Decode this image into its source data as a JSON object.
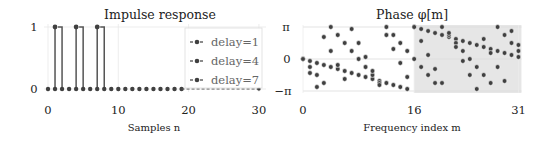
{
  "chart_data": [
    {
      "type": "line",
      "title": "Impulse response",
      "xlabel": "Samples n",
      "ylabel": "",
      "xlim": [
        0,
        31
      ],
      "ylim": [
        0,
        1
      ],
      "xticks": [
        0,
        10,
        20,
        30
      ],
      "yticks": [
        "0",
        "1"
      ],
      "grid": true,
      "legend_position": "upper right",
      "legend": [
        "delay=1",
        "delay=4",
        "delay=7"
      ],
      "series": [
        {
          "name": "delay=1",
          "delay": 1,
          "x": [
            0,
            1,
            2,
            3,
            4,
            5,
            6,
            7,
            8,
            9,
            10,
            11,
            12,
            13,
            14,
            15,
            16,
            17,
            18,
            19,
            20,
            21,
            22,
            23,
            24,
            25,
            26,
            27,
            28,
            29,
            30,
            31
          ],
          "values": [
            0,
            1,
            0,
            0,
            0,
            0,
            0,
            0,
            0,
            0,
            0,
            0,
            0,
            0,
            0,
            0,
            0,
            0,
            0,
            0,
            0,
            0,
            0,
            0,
            0,
            0,
            0,
            0,
            0,
            0,
            0,
            0
          ]
        },
        {
          "name": "delay=4",
          "delay": 4,
          "x": [
            0,
            1,
            2,
            3,
            4,
            5,
            6,
            7,
            8,
            9,
            10,
            11,
            12,
            13,
            14,
            15,
            16,
            17,
            18,
            19,
            20,
            21,
            22,
            23,
            24,
            25,
            26,
            27,
            28,
            29,
            30,
            31
          ],
          "values": [
            0,
            0,
            0,
            0,
            1,
            0,
            0,
            0,
            0,
            0,
            0,
            0,
            0,
            0,
            0,
            0,
            0,
            0,
            0,
            0,
            0,
            0,
            0,
            0,
            0,
            0,
            0,
            0,
            0,
            0,
            0,
            0
          ]
        },
        {
          "name": "delay=7",
          "delay": 7,
          "x": [
            0,
            1,
            2,
            3,
            4,
            5,
            6,
            7,
            8,
            9,
            10,
            11,
            12,
            13,
            14,
            15,
            16,
            17,
            18,
            19,
            20,
            21,
            22,
            23,
            24,
            25,
            26,
            27,
            28,
            29,
            30,
            31
          ],
          "values": [
            0,
            0,
            0,
            0,
            0,
            0,
            0,
            1,
            0,
            0,
            0,
            0,
            0,
            0,
            0,
            0,
            0,
            0,
            0,
            0,
            0,
            0,
            0,
            0,
            0,
            0,
            0,
            0,
            0,
            0,
            0,
            0
          ]
        }
      ]
    },
    {
      "type": "scatter",
      "title": "Phase φ[m]",
      "xlabel": "Frequency index m",
      "ylabel": "",
      "xlim": [
        0,
        31
      ],
      "ylim": [
        -3.1416,
        3.1416
      ],
      "xticks": [
        0,
        16,
        31
      ],
      "yticks": [
        "−π",
        "0",
        "π"
      ],
      "grid": true,
      "shaded_region": {
        "x_from": 16,
        "x_to": 31,
        "color": "#e6e6e6"
      },
      "formula": "phi[m] = wrap(-2*pi*delay*m/32)",
      "series": [
        {
          "name": "delay=1",
          "delay": 1
        },
        {
          "name": "delay=4",
          "delay": 4
        },
        {
          "name": "delay=7",
          "delay": 7
        }
      ]
    }
  ],
  "colors": {
    "marker": "#404040",
    "line": "#555555",
    "grid": "#e8e8e8",
    "shade": "#e6e6e6",
    "legend_border": "#dddddd"
  },
  "labels": {
    "left_title": "Impulse response",
    "left_xlabel": "Samples n",
    "right_title": "Phase φ[m]",
    "right_xlabel": "Frequency index m",
    "legend": [
      "delay=1",
      "delay=4",
      "delay=7"
    ]
  }
}
